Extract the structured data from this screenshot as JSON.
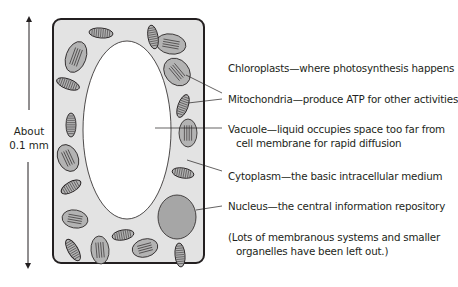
{
  "scale": {
    "line1": "About",
    "line2": "0.1 mm"
  },
  "labels": {
    "chloroplasts": "Chloroplasts—where photosynthesis happens",
    "mitochondria": "Mitochondria—produce ATP for other activities",
    "vacuole_1": "Vacuole—liquid occupies space too far from",
    "vacuole_2": "cell membrane for rapid diffusion",
    "cytoplasm": "Cytoplasm—the basic intracellular medium",
    "nucleus": "Nucleus—the central information repository",
    "note_1": "(Lots of membranous systems and smaller",
    "note_2": "organelles have been left out.)"
  },
  "colors": {
    "cytoplasm": "#e3e3e3",
    "organelle": "#b3b3b3",
    "nucleus": "#a6a6a6",
    "outline": "#231f20"
  },
  "organelles": {
    "chloroplasts": [
      {
        "cx": 76,
        "cy": 57,
        "rx": 10,
        "ry": 16,
        "rot": 20
      },
      {
        "cx": 171,
        "cy": 44,
        "rx": 15,
        "ry": 10,
        "rot": 10
      },
      {
        "cx": 177,
        "cy": 72,
        "rx": 12,
        "ry": 15,
        "rot": -40
      },
      {
        "cx": 188,
        "cy": 133,
        "rx": 9,
        "ry": 14,
        "rot": 0
      },
      {
        "cx": 68,
        "cy": 158,
        "rx": 10,
        "ry": 14,
        "rot": -25
      },
      {
        "cx": 75,
        "cy": 219,
        "rx": 13,
        "ry": 9,
        "rot": 10
      },
      {
        "cx": 100,
        "cy": 250,
        "rx": 9,
        "ry": 14,
        "rot": -5
      },
      {
        "cx": 145,
        "cy": 248,
        "rx": 13,
        "ry": 9,
        "rot": -15
      }
    ],
    "mitochondria": [
      {
        "cx": 101,
        "cy": 33,
        "rx": 12,
        "ry": 5,
        "rot": 5
      },
      {
        "cx": 153,
        "cy": 37,
        "rx": 5,
        "ry": 12,
        "rot": -10
      },
      {
        "cx": 68,
        "cy": 84,
        "rx": 12,
        "ry": 5,
        "rot": 20
      },
      {
        "cx": 183,
        "cy": 106,
        "rx": 5,
        "ry": 12,
        "rot": 20
      },
      {
        "cx": 71,
        "cy": 125,
        "rx": 5,
        "ry": 12,
        "rot": 0
      },
      {
        "cx": 71,
        "cy": 187,
        "rx": 11,
        "ry": 5,
        "rot": -30
      },
      {
        "cx": 183,
        "cy": 173,
        "rx": 11,
        "ry": 5,
        "rot": 10
      },
      {
        "cx": 123,
        "cy": 235,
        "rx": 11,
        "ry": 5,
        "rot": -10
      },
      {
        "cx": 73,
        "cy": 250,
        "rx": 5,
        "ry": 12,
        "rot": -30
      },
      {
        "cx": 180,
        "cy": 255,
        "rx": 5,
        "ry": 12,
        "rot": -5
      }
    ]
  }
}
